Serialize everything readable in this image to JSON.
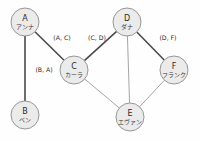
{
  "figure": {
    "width": 200,
    "height": 141,
    "background_color": "#fefefe",
    "node_fill_color": "#ebebeb",
    "node_stroke_color": "#8c8c8c",
    "edge_thick_color": "#4a4a4a",
    "edge_thin_color": "#9a9a9a"
  },
  "chart_data": {
    "type": "diagram",
    "diagram_kind": "undirected-graph",
    "title": "",
    "nodes": [
      {
        "id": "A",
        "label": "A",
        "name": "アンナ",
        "x": 25,
        "y": 22,
        "r": 14
      },
      {
        "id": "B",
        "label": "B",
        "name": "ベン",
        "x": 25,
        "y": 115,
        "r": 14
      },
      {
        "id": "C",
        "label": "C",
        "name": "カーラ",
        "x": 74,
        "y": 70,
        "r": 14
      },
      {
        "id": "D",
        "label": "D",
        "name": "ダナ",
        "x": 127,
        "y": 22,
        "r": 14
      },
      {
        "id": "E",
        "label": "E",
        "name": "エヴァン",
        "x": 130,
        "y": 117,
        "r": 14
      },
      {
        "id": "F",
        "label": "F",
        "name": "フランク",
        "x": 174,
        "y": 70,
        "r": 14
      }
    ],
    "edges": [
      {
        "from": "A",
        "to": "B",
        "style": "thick",
        "label": "(B, A)",
        "label_x": 44,
        "label_y": 72
      },
      {
        "from": "A",
        "to": "C",
        "style": "thick",
        "label": "(A, C)",
        "label_x": 62,
        "label_y": 40
      },
      {
        "from": "C",
        "to": "D",
        "style": "thick",
        "label": "(C, D)",
        "label_x": 97,
        "label_y": 40
      },
      {
        "from": "D",
        "to": "F",
        "style": "thick",
        "label": "(D, F)",
        "label_x": 168,
        "label_y": 40
      },
      {
        "from": "C",
        "to": "E",
        "style": "thin",
        "label": ""
      },
      {
        "from": "D",
        "to": "E",
        "style": "thin",
        "label": ""
      },
      {
        "from": "E",
        "to": "F",
        "style": "thin",
        "label": ""
      }
    ],
    "labeled_edge_count": 4,
    "unlabeled_edge_count": 3
  }
}
